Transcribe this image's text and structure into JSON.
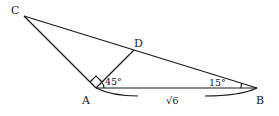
{
  "diagram": {
    "type": "geometry-triangle",
    "points": {
      "A": {
        "label": "A",
        "x": 96,
        "y": 88
      },
      "B": {
        "label": "B",
        "x": 257,
        "y": 88
      },
      "C": {
        "label": "C",
        "x": 24,
        "y": 16
      },
      "D": {
        "label": "D",
        "x": 134,
        "y": 50
      }
    },
    "segments": [
      "CA",
      "CB",
      "AB",
      "AD"
    ],
    "angles": {
      "DAB": "45°",
      "ABD": "15°",
      "CAD": "right-angle"
    },
    "lengths": {
      "AB": "√6"
    },
    "colors": {
      "stroke": "#1a1a1a",
      "background": "#ffffff"
    }
  }
}
